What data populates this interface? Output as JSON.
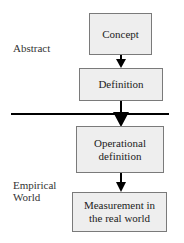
{
  "diagram": {
    "zones": {
      "abstract_label": "Abstract",
      "empirical_label_line1": "Empirical",
      "empirical_label_line2": "World"
    },
    "nodes": [
      {
        "id": "concept",
        "lines": [
          "Concept"
        ]
      },
      {
        "id": "definition",
        "lines": [
          "Definition"
        ]
      },
      {
        "id": "operational-definition",
        "lines": [
          "Operational",
          "definition"
        ]
      },
      {
        "id": "measurement",
        "lines": [
          "Measurement in",
          "the real world"
        ]
      }
    ],
    "edges": [
      {
        "from": "concept",
        "to": "definition"
      },
      {
        "from": "definition",
        "to": "operational-definition"
      },
      {
        "from": "operational-definition",
        "to": "measurement"
      }
    ],
    "divider": "horizontal line separating Abstract and Empirical World",
    "colors": {
      "box_fill": "#eeeeee",
      "box_border": "#7a7a7a",
      "arrow": "#000000",
      "divider": "#000000"
    }
  }
}
